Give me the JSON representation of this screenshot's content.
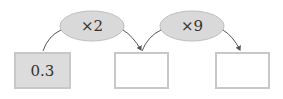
{
  "diagram": {
    "boxes": [
      {
        "label": "0.3",
        "filled": true
      },
      {
        "label": "",
        "filled": false
      },
      {
        "label": "",
        "filled": false
      }
    ],
    "operations": [
      {
        "label": "×2"
      },
      {
        "label": "×9"
      }
    ],
    "colors": {
      "ellipse_fill": "#d9d9d9",
      "box_border": "#c8c8c8",
      "box_fill": "#dcdcdc",
      "arrow": "#555555"
    }
  }
}
